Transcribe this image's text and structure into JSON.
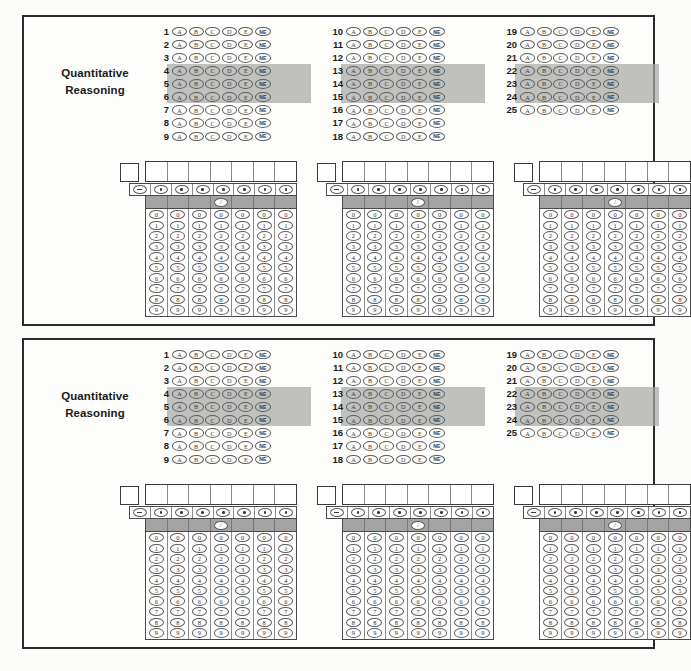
{
  "sheet": {
    "background_color": "#fbfbf9",
    "panel_border_color": "#2b2b2b",
    "highlight_color": "#a8a8a8"
  },
  "sections": [
    {
      "id": "section-top",
      "title_line1": "Quantitative",
      "title_line2": "Reasoning",
      "mc_choices": [
        "A",
        "B",
        "C",
        "D",
        "E",
        "NE"
      ],
      "mc_columns": [
        {
          "numbers": [
            "1",
            "2",
            "3",
            "4",
            "5",
            "6",
            "7",
            "8",
            "9"
          ],
          "highlighted": [
            "4",
            "5",
            "6"
          ]
        },
        {
          "numbers": [
            "10",
            "11",
            "12",
            "13",
            "14",
            "15",
            "16",
            "17",
            "18"
          ],
          "highlighted": [
            "13",
            "14",
            "15"
          ]
        },
        {
          "numbers": [
            "19",
            "20",
            "21",
            "22",
            "23",
            "24",
            "25"
          ],
          "highlighted": [
            "22",
            "23",
            "24"
          ]
        }
      ],
      "gridins": [
        {
          "sign_row": [
            "-",
            ".",
            ".",
            ".",
            ".",
            ".",
            ".",
            "."
          ],
          "slash": "/",
          "slash_column": 4,
          "digits": [
            "0",
            "1",
            "2",
            "3",
            "4",
            "5",
            "6",
            "7",
            "8",
            "9"
          ],
          "digit_columns": 7
        },
        {
          "sign_row": [
            "-",
            ".",
            ".",
            ".",
            ".",
            ".",
            ".",
            "."
          ],
          "slash": "/",
          "slash_column": 4,
          "digits": [
            "0",
            "1",
            "2",
            "3",
            "4",
            "5",
            "6",
            "7",
            "8",
            "9"
          ],
          "digit_columns": 7
        },
        {
          "sign_row": [
            "-",
            ".",
            ".",
            ".",
            ".",
            ".",
            ".",
            "."
          ],
          "slash": "/",
          "slash_column": 4,
          "digits": [
            "0",
            "1",
            "2",
            "3",
            "4",
            "5",
            "6",
            "7",
            "8",
            "9"
          ],
          "digit_columns": 7
        }
      ]
    },
    {
      "id": "section-bottom",
      "title_line1": "Quantitative",
      "title_line2": "Reasoning",
      "mc_choices": [
        "A",
        "B",
        "C",
        "D",
        "E",
        "NE"
      ],
      "mc_columns": [
        {
          "numbers": [
            "1",
            "2",
            "3",
            "4",
            "5",
            "6",
            "7",
            "8",
            "9"
          ],
          "highlighted": [
            "4",
            "5",
            "6"
          ]
        },
        {
          "numbers": [
            "10",
            "11",
            "12",
            "13",
            "14",
            "15",
            "16",
            "17",
            "18"
          ],
          "highlighted": [
            "13",
            "14",
            "15"
          ]
        },
        {
          "numbers": [
            "19",
            "20",
            "21",
            "22",
            "23",
            "24",
            "25"
          ],
          "highlighted": [
            "22",
            "23",
            "24"
          ]
        }
      ],
      "gridins": [
        {
          "sign_row": [
            "-",
            ".",
            ".",
            ".",
            ".",
            ".",
            ".",
            "."
          ],
          "slash": "/",
          "slash_column": 4,
          "digits": [
            "0",
            "1",
            "2",
            "3",
            "4",
            "5",
            "6",
            "7",
            "8",
            "9"
          ],
          "digit_columns": 7
        },
        {
          "sign_row": [
            "-",
            ".",
            ".",
            ".",
            ".",
            ".",
            ".",
            "."
          ],
          "slash": "/",
          "slash_column": 4,
          "digits": [
            "0",
            "1",
            "2",
            "3",
            "4",
            "5",
            "6",
            "7",
            "8",
            "9"
          ],
          "digit_columns": 7
        },
        {
          "sign_row": [
            "-",
            ".",
            ".",
            ".",
            ".",
            ".",
            ".",
            "."
          ],
          "slash": "/",
          "slash_column": 4,
          "digits": [
            "0",
            "1",
            "2",
            "3",
            "4",
            "5",
            "6",
            "7",
            "8",
            "9"
          ],
          "digit_columns": 7
        }
      ]
    }
  ]
}
